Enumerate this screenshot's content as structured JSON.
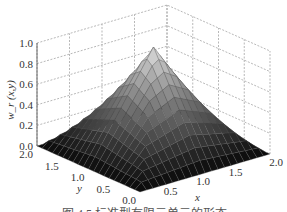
{
  "chart_data": {
    "type": "surface3d",
    "title": "",
    "caption": "图 4.5  标准型有限元单元的形态",
    "zlabel": "w_r (x,y)",
    "xlabel": "x",
    "ylabel": "y",
    "xlim": [
      0,
      2
    ],
    "ylim": [
      0,
      2
    ],
    "zlim": [
      0,
      1
    ],
    "x_ticks": [
      "0.5",
      "1.0",
      "1.5",
      "2.0"
    ],
    "y_ticks": [
      "0.0",
      "0.5",
      "1.0",
      "1.5",
      "2.0"
    ],
    "z_ticks": [
      "0.0",
      "0.2",
      "0.4",
      "0.6",
      "0.8",
      "1.0"
    ],
    "grid": true,
    "colormap": "gray",
    "peak": {
      "x": 1.0,
      "y": 1.0,
      "z": 1.0
    },
    "grid_resolution": 10
  }
}
